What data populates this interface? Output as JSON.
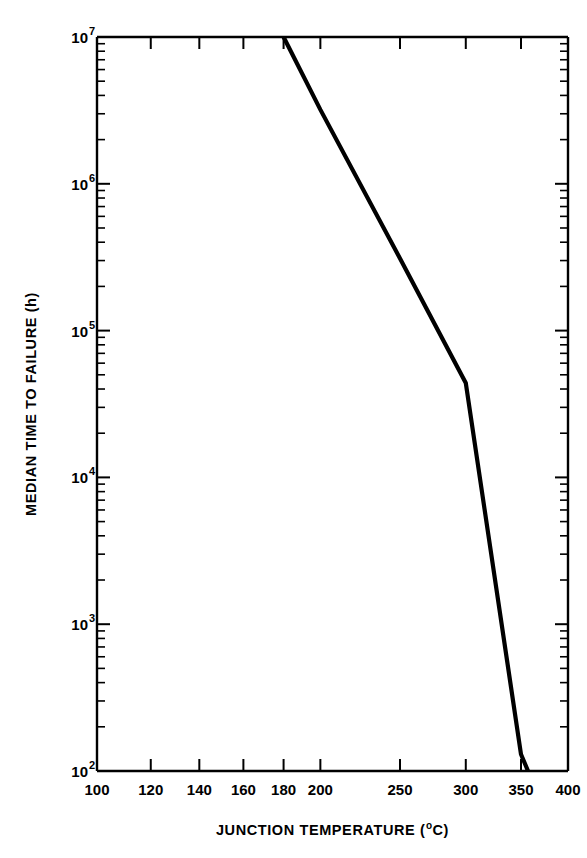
{
  "figure": {
    "background_color": "#ffffff",
    "ink_color": "#000000"
  },
  "chart_data": {
    "type": "line",
    "title": "",
    "subtitle": "",
    "xlabel": "JUNCTION TEMPERATURE (",
    "xlabel_sup": "o",
    "xlabel_tail": "C)",
    "xlabel_full": "JUNCTION TEMPERATURE (oC)",
    "ylabel": "MEDIAN TIME TO FAILURE (h)",
    "x_scale": "reciprocal-temperature (Arrhenius, 1/T in K)",
    "y_scale": "log10",
    "xlim": [
      100,
      400
    ],
    "ylim": [
      100,
      10000000
    ],
    "grid": false,
    "legend": false,
    "legend_position": "none",
    "x_tick_labels": [
      "100",
      "120",
      "140",
      "160",
      "180",
      "200",
      "250",
      "300",
      "350",
      "400"
    ],
    "x_tick_values": [
      100,
      120,
      140,
      160,
      180,
      200,
      250,
      300,
      350,
      400
    ],
    "y_tick_labels": [
      "10^7",
      "10^6",
      "10^5",
      "10^4",
      "10^3",
      "10^2"
    ],
    "y_tick_values": [
      10000000,
      1000000,
      100000,
      10000,
      1000,
      100
    ],
    "y_tick_base": "10",
    "y_tick_exponents": [
      "7",
      "6",
      "5",
      "4",
      "3",
      "2"
    ],
    "y_minor_ticks_per_decade": [
      2,
      3,
      4,
      5,
      6,
      7,
      8,
      9
    ],
    "series": [
      {
        "name": "median time to failure",
        "line_style": "solid",
        "line_width_px": 4.2,
        "color": "#000000",
        "x": [
          180,
          200,
          250,
          300,
          350,
          357
        ],
        "y": [
          10000000,
          3200000,
          310000,
          44000,
          130,
          100
        ],
        "points": [
          {
            "temperature_C": 180,
            "mttf_hours": 10000000
          },
          {
            "temperature_C": 200,
            "mttf_hours": 3200000
          },
          {
            "temperature_C": 250,
            "mttf_hours": 310000
          },
          {
            "temperature_C": 300,
            "mttf_hours": 44000
          },
          {
            "temperature_C": 350,
            "mttf_hours": 130
          },
          {
            "temperature_C": 357,
            "mttf_hours": 100
          }
        ],
        "note": "straight line on Arrhenius axes; activation-energy fit"
      }
    ],
    "annotations": []
  }
}
